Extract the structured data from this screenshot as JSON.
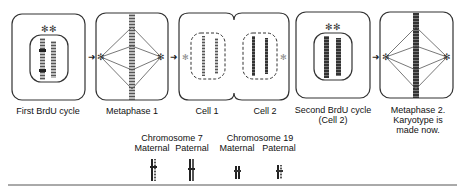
{
  "stages": [
    {
      "id": "first-brdu",
      "label_lines": [
        "First BrdU cycle"
      ]
    },
    {
      "id": "metaphase-1",
      "label_lines": [
        "Metaphase 1"
      ]
    },
    {
      "id": "cell-1",
      "label_lines": [
        "Cell 1"
      ]
    },
    {
      "id": "cell-2",
      "label_lines": [
        "Cell 2"
      ]
    },
    {
      "id": "second-brdu",
      "label_lines": [
        "Second BrdU cycle",
        "(Cell 2)"
      ]
    },
    {
      "id": "metaphase-2",
      "label_lines": [
        "Metaphase 2.",
        "Karyotype is",
        "made now."
      ]
    }
  ],
  "legend": {
    "groups": [
      {
        "title": "Chromosome 7",
        "items": [
          "Maternal",
          "Paternal"
        ]
      },
      {
        "title": "Chromosome 19",
        "items": [
          "Maternal",
          "Paternal"
        ]
      }
    ]
  },
  "colors": {
    "line": "#333333",
    "chromatid_dark": "#222222",
    "chromatid_light": "#999999"
  }
}
